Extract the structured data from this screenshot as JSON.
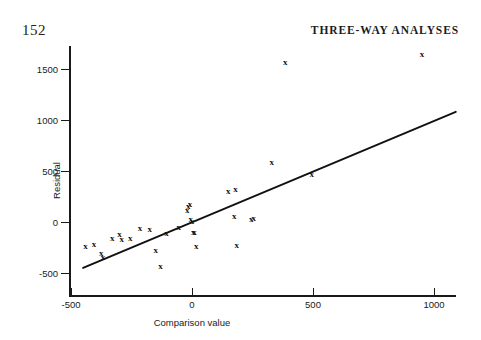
{
  "page": {
    "folio": "152",
    "running_head": "THREE-WAY ANALYSES"
  },
  "chart_data": {
    "type": "scatter",
    "title": "",
    "xlabel": "Comparison value",
    "ylabel": "Residual",
    "xlim": [
      -500,
      1100
    ],
    "ylim": [
      -600,
      1800
    ],
    "xticks": [
      -500,
      0,
      500,
      1000
    ],
    "xticklabels": [
      "-500",
      "0",
      "500",
      "1000"
    ],
    "yticks": [
      -500,
      0,
      500,
      1000,
      1500
    ],
    "yticklabels": [
      "-500",
      "0",
      "500",
      "1000",
      "1500"
    ],
    "grid": false,
    "legend": null,
    "marker": "x",
    "points": [
      {
        "x": -440,
        "y": -240
      },
      {
        "x": -405,
        "y": -215
      },
      {
        "x": -375,
        "y": -305
      },
      {
        "x": -368,
        "y": -345
      },
      {
        "x": -330,
        "y": -160
      },
      {
        "x": -300,
        "y": -120
      },
      {
        "x": -290,
        "y": -170
      },
      {
        "x": -255,
        "y": -160
      },
      {
        "x": -215,
        "y": -60
      },
      {
        "x": -175,
        "y": -65
      },
      {
        "x": -150,
        "y": -275
      },
      {
        "x": -130,
        "y": -430
      },
      {
        "x": -105,
        "y": -110
      },
      {
        "x": -55,
        "y": -50
      },
      {
        "x": -20,
        "y": 120
      },
      {
        "x": -15,
        "y": 160
      },
      {
        "x": -8,
        "y": 175
      },
      {
        "x": -5,
        "y": 30
      },
      {
        "x": 0,
        "y": 10
      },
      {
        "x": 5,
        "y": -95
      },
      {
        "x": 10,
        "y": -100
      },
      {
        "x": 18,
        "y": -240
      },
      {
        "x": 150,
        "y": 300
      },
      {
        "x": 175,
        "y": 60
      },
      {
        "x": 180,
        "y": 320
      },
      {
        "x": 185,
        "y": -230
      },
      {
        "x": 245,
        "y": 30
      },
      {
        "x": 255,
        "y": 40
      },
      {
        "x": 330,
        "y": 590
      },
      {
        "x": 385,
        "y": 1570
      },
      {
        "x": 495,
        "y": 470
      },
      {
        "x": 950,
        "y": 1650
      }
    ],
    "fit_line": {
      "kind": "straight-line",
      "x_start": -450,
      "y_start": -450,
      "x_end": 1090,
      "y_end": 1080
    }
  }
}
